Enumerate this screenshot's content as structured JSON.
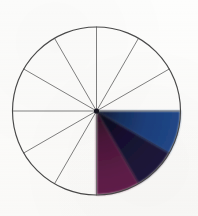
{
  "figure": {
    "medium": "scanned hand-drawn diagram",
    "background_color": "#fdfdfc",
    "outline_color": "#4a4a4a",
    "spoke_color": "#6a6a6a"
  },
  "wheel": {
    "center_x": 96.5,
    "center_y": 111,
    "radius": 84,
    "sector_count": 12,
    "sector_angle_degrees": 30,
    "filled_sector_count": 3,
    "empty_sector_count": 9,
    "spoke_angles_degrees": [
      0,
      30,
      60,
      90,
      120,
      150,
      180,
      210,
      240,
      270,
      300,
      330
    ]
  },
  "chart_data": {
    "type": "pie",
    "categories": [
      "sector-1",
      "sector-2",
      "sector-3",
      "sector-4",
      "sector-5",
      "sector-6",
      "sector-7",
      "sector-8",
      "sector-9",
      "sector-10",
      "sector-11",
      "sector-12"
    ],
    "values": [
      30,
      30,
      30,
      30,
      30,
      30,
      30,
      30,
      30,
      30,
      30,
      30
    ],
    "unit": "degrees",
    "legend": "none",
    "grid": false,
    "sectors": [
      {
        "index": 1,
        "name": "blue-sector",
        "start_angle": 0,
        "end_angle": -30,
        "filled": true,
        "fill_color": "#1c3f7d",
        "fill_color_inner": "#16203f",
        "label": "blue"
      },
      {
        "index": 2,
        "name": "dark-navy-sector",
        "start_angle": -30,
        "end_angle": -60,
        "filled": true,
        "fill_color": "#1a1430",
        "fill_color_inner": "#0e0a1c",
        "label": "dark navy"
      },
      {
        "index": 3,
        "name": "wine-purple-sector",
        "start_angle": -60,
        "end_angle": -90,
        "filled": true,
        "fill_color": "#5c1c47",
        "fill_color_inner": "#3a1230",
        "label": "wine purple"
      },
      {
        "index": 4,
        "name": "empty-sector-4",
        "start_angle": -90,
        "end_angle": -120,
        "filled": false,
        "fill_color": "#fdfdfc",
        "label": ""
      },
      {
        "index": 5,
        "name": "empty-sector-5",
        "start_angle": -120,
        "end_angle": -150,
        "filled": false,
        "fill_color": "#fdfdfc",
        "label": ""
      },
      {
        "index": 6,
        "name": "empty-sector-6",
        "start_angle": -150,
        "end_angle": -180,
        "filled": false,
        "fill_color": "#fdfdfc",
        "label": ""
      },
      {
        "index": 7,
        "name": "empty-sector-7",
        "start_angle": 180,
        "end_angle": 150,
        "filled": false,
        "fill_color": "#fdfdfc",
        "label": ""
      },
      {
        "index": 8,
        "name": "empty-sector-8",
        "start_angle": 150,
        "end_angle": 120,
        "filled": false,
        "fill_color": "#fdfdfc",
        "label": ""
      },
      {
        "index": 9,
        "name": "empty-sector-9",
        "start_angle": 120,
        "end_angle": 90,
        "filled": false,
        "fill_color": "#fdfdfc",
        "label": ""
      },
      {
        "index": 10,
        "name": "empty-sector-10",
        "start_angle": 90,
        "end_angle": 60,
        "filled": false,
        "fill_color": "#fdfdfc",
        "label": ""
      },
      {
        "index": 11,
        "name": "empty-sector-11",
        "start_angle": 60,
        "end_angle": 30,
        "filled": false,
        "fill_color": "#fdfdfc",
        "label": ""
      },
      {
        "index": 12,
        "name": "empty-sector-12",
        "start_angle": 30,
        "end_angle": 0,
        "filled": false,
        "fill_color": "#fdfdfc",
        "label": ""
      }
    ]
  }
}
